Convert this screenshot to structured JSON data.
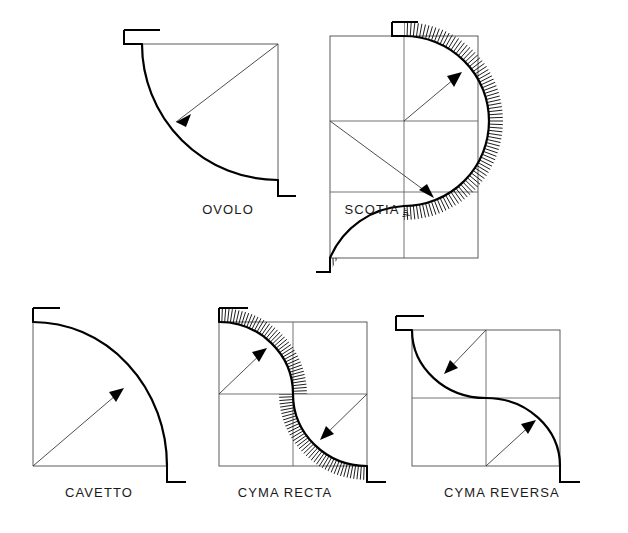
{
  "sheet": {
    "title": "Architectural Molding Profiles",
    "background_color": "#ffffff",
    "ink_color": "#000000",
    "construction_line_color": "#4a4a4a",
    "width": 628,
    "height": 533
  },
  "figures": [
    {
      "id": "ovolo",
      "label": "OVOLO",
      "label_x": 228,
      "label_y": 214,
      "profile_type": "convex-quarter-round",
      "grid": "none",
      "arc_count": 1,
      "radius_arrow_count": 1,
      "box": {
        "x": 142,
        "y": 44,
        "w": 136,
        "h": 136
      }
    },
    {
      "id": "scotia",
      "label": "SCOTIA",
      "label_x": 372,
      "label_y": 214,
      "profile_type": "double-concave-hollow",
      "grid": "2x4",
      "arc_count": 2,
      "radius_arrow_count": 2,
      "box": {
        "x": 330,
        "y": 36,
        "w": 148,
        "h": 222
      }
    },
    {
      "id": "cavetto",
      "label": "CAVETTO",
      "label_x": 99,
      "label_y": 497,
      "profile_type": "concave-quarter-round",
      "grid": "none",
      "arc_count": 1,
      "radius_arrow_count": 1,
      "box": {
        "x": 33,
        "y": 322,
        "w": 134,
        "h": 144
      }
    },
    {
      "id": "cyma-recta",
      "label": "CYMA RECTA",
      "label_x": 285,
      "label_y": 497,
      "profile_type": "s-curve-concave-over-convex",
      "grid": "2x2",
      "arc_count": 2,
      "radius_arrow_count": 2,
      "box": {
        "x": 219,
        "y": 322,
        "w": 148,
        "h": 144
      }
    },
    {
      "id": "cyma-reversa",
      "label": "CYMA REVERSA",
      "label_x": 502,
      "label_y": 497,
      "profile_type": "s-curve-convex-over-concave",
      "grid": "2x2",
      "arc_count": 2,
      "radius_arrow_count": 2,
      "box": {
        "x": 412,
        "y": 330,
        "w": 148,
        "h": 136
      }
    }
  ]
}
